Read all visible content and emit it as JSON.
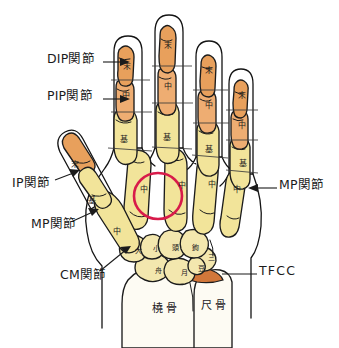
{
  "figure": {
    "title_partial_top": "…",
    "alt_description": "hand-skeleton-anatomy-diagram",
    "colors": {
      "phalanx_distal_orange": "#e8a05c",
      "phalanx_mid_orange": "#eead72",
      "metacarpal_yellow": "#f2e49a",
      "carpal_yellow": "#f3e7ae",
      "radius_ulna_white": "#fdfbf3",
      "tfcc_orange": "#d2773a",
      "outline": "#1c1c1c",
      "highlight_circle": "#d81b4a",
      "label_text": "#1b1b1b",
      "background": "#ffffff"
    }
  },
  "callouts": [
    {
      "id": "dip",
      "label": "DIP関節",
      "x": 47,
      "y": 59,
      "leader": "right"
    },
    {
      "id": "pip",
      "label": "PIP関節",
      "x": 47,
      "y": 95,
      "leader": "right"
    },
    {
      "id": "ip",
      "label": "IP関節",
      "x": 12,
      "y": 183,
      "leader": "right-up"
    },
    {
      "id": "mp_thumb",
      "label": "MP関節",
      "x": 31,
      "y": 224,
      "leader": "right-up"
    },
    {
      "id": "cm",
      "label": "CM関節",
      "x": 60,
      "y": 276,
      "leader": "right-up"
    },
    {
      "id": "mp_little",
      "label": "MP関節",
      "x": 279,
      "y": 185,
      "leader": "left"
    },
    {
      "id": "tfcc",
      "label": "TFCC",
      "x": 259,
      "y": 271,
      "leader": "left"
    }
  ],
  "bone_labels": [
    {
      "id": "idx-distal",
      "text": "末",
      "x": 123,
      "y": 63
    },
    {
      "id": "mid-distal",
      "text": "末",
      "x": 164,
      "y": 42
    },
    {
      "id": "ring-distal",
      "text": "末",
      "x": 205,
      "y": 67
    },
    {
      "id": "lit-distal",
      "text": "末",
      "x": 238,
      "y": 92
    },
    {
      "id": "idx-mid",
      "text": "中",
      "x": 122,
      "y": 92
    },
    {
      "id": "mid-mid",
      "text": "中",
      "x": 164,
      "y": 83
    },
    {
      "id": "ring-mid",
      "text": "中",
      "x": 205,
      "y": 102
    },
    {
      "id": "lit-mid",
      "text": "中",
      "x": 238,
      "y": 122
    },
    {
      "id": "idx-prox",
      "text": "基",
      "x": 120,
      "y": 136
    },
    {
      "id": "mid-prox",
      "text": "基",
      "x": 163,
      "y": 134
    },
    {
      "id": "ring-prox",
      "text": "基",
      "x": 205,
      "y": 146
    },
    {
      "id": "lit-prox",
      "text": "基",
      "x": 239,
      "y": 160
    },
    {
      "id": "idx-meta",
      "text": "中",
      "x": 140,
      "y": 186
    },
    {
      "id": "mid-meta",
      "text": "中",
      "x": 178,
      "y": 182
    },
    {
      "id": "ring-meta",
      "text": "中",
      "x": 208,
      "y": 181
    },
    {
      "id": "lit-meta",
      "text": "中",
      "x": 233,
      "y": 186
    },
    {
      "id": "thumb-distal",
      "text": "末",
      "x": 71,
      "y": 161
    },
    {
      "id": "thumb-prox",
      "text": "基",
      "x": 88,
      "y": 197
    },
    {
      "id": "thumb-meta",
      "text": "中",
      "x": 113,
      "y": 228
    },
    {
      "id": "trapezium",
      "text": "大",
      "x": 135,
      "y": 248
    },
    {
      "id": "trapezoid",
      "text": "小",
      "x": 153,
      "y": 246
    },
    {
      "id": "capitate",
      "text": "頭",
      "x": 172,
      "y": 245
    },
    {
      "id": "hamate",
      "text": "鉤",
      "x": 192,
      "y": 245
    },
    {
      "id": "triquetrum",
      "text": "三",
      "x": 208,
      "y": 255
    },
    {
      "id": "scaphoid",
      "text": "舟",
      "x": 155,
      "y": 268
    },
    {
      "id": "lunate",
      "text": "月",
      "x": 181,
      "y": 270
    },
    {
      "id": "pisiform",
      "text": "豆",
      "x": 198,
      "y": 266
    }
  ],
  "forearm_labels": [
    {
      "id": "radius",
      "text": "橈骨",
      "x": 152,
      "y": 303
    },
    {
      "id": "ulna",
      "text": "尺骨",
      "x": 201,
      "y": 300
    }
  ],
  "highlight": {
    "id": "index-metacarpal-highlight",
    "shape": "ellipse",
    "cx": 158,
    "cy": 196,
    "rx": 24,
    "ry": 23,
    "stroke": "#d81b4a",
    "stroke_width": 2.6
  }
}
